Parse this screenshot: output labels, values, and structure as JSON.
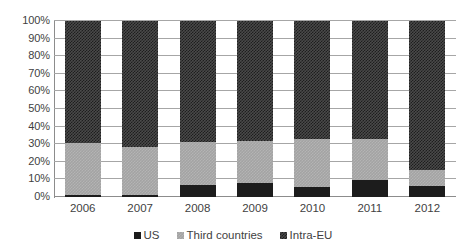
{
  "chart_data": {
    "type": "bar",
    "subtype": "stacked-percentage",
    "title": "",
    "subtitle": "",
    "xlabel": "",
    "ylabel": "",
    "categories": [
      "2006",
      "2007",
      "2008",
      "2009",
      "2010",
      "2011",
      "2012"
    ],
    "series": [
      {
        "name": "US",
        "color": "#1c1c1c",
        "pattern": "solid",
        "values": [
          1,
          1,
          7,
          8,
          5.5,
          9.5,
          6
        ]
      },
      {
        "name": "Third countries",
        "color": "#a3a3a3",
        "pattern": "light-checker",
        "values": [
          29.5,
          27.5,
          24,
          24,
          27.5,
          23.5,
          9.5
        ]
      },
      {
        "name": "Intra-EU",
        "color": "#4a4a4a",
        "pattern": "dark-checker",
        "values": [
          69.5,
          71.5,
          69,
          68,
          67,
          67,
          84.5
        ]
      }
    ],
    "cumulative_tops": {
      "US": [
        1,
        1,
        7,
        8,
        5.5,
        9.5,
        6
      ],
      "Third countries": [
        30.5,
        28.5,
        31,
        32,
        33,
        33,
        15.5
      ],
      "Intra-EU": [
        100,
        100,
        100,
        100,
        100,
        100,
        100
      ]
    },
    "ylim": [
      0,
      100
    ],
    "ytick_values": [
      0,
      10,
      20,
      30,
      40,
      50,
      60,
      70,
      80,
      90,
      100
    ],
    "ytick_labels": [
      "0%",
      "10%",
      "20%",
      "30%",
      "40%",
      "50%",
      "60%",
      "70%",
      "80%",
      "90%",
      "100%"
    ],
    "grid": true,
    "grid_axis": "y",
    "legend_position": "bottom",
    "legend_entries": [
      "US",
      "Third countries",
      "Intra-EU"
    ]
  },
  "axes": {
    "y_labels": [
      "100%",
      "90%",
      "80%",
      "70%",
      "60%",
      "50%",
      "40%",
      "30%",
      "20%",
      "10%",
      "0%"
    ],
    "x_labels": [
      "2006",
      "2007",
      "2008",
      "2009",
      "2010",
      "2011",
      "2012"
    ]
  },
  "legend": {
    "items": [
      {
        "label": "US",
        "swatch_name": "legend-swatch-us"
      },
      {
        "label": "Third countries",
        "swatch_name": "legend-swatch-third-countries"
      },
      {
        "label": "Intra-EU",
        "swatch_name": "legend-swatch-intra-eu"
      }
    ]
  },
  "colors": {
    "us": "#1c1c1c",
    "third_countries": "#a3a3a3",
    "intra_eu": "#4a4a4a",
    "gridline": "#a6a6a6",
    "axis": "#8c8c8c",
    "text": "#3f3f3f",
    "background": "#ffffff"
  }
}
